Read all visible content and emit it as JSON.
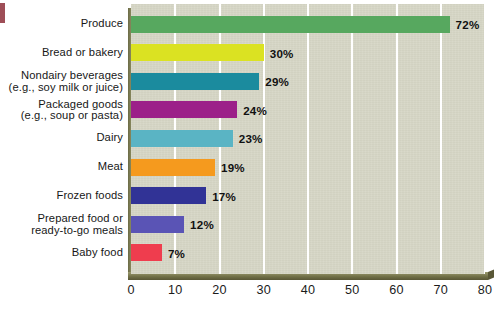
{
  "chart_data": {
    "type": "bar",
    "orientation": "horizontal",
    "title": "",
    "xlabel": "",
    "ylabel": "",
    "xlim": [
      0,
      80
    ],
    "xticks": [
      "0",
      "10",
      "20",
      "30",
      "40",
      "50",
      "60",
      "70",
      "80"
    ],
    "grid": "vertical-white-gridlines",
    "legend": "none",
    "value_suffix": "%",
    "categories": [
      "Produce",
      "Bread or bakery",
      "Nondairy beverages\n(e.g., soy milk or juice)",
      "Packaged goods\n(e.g., soup or pasta)",
      "Dairy",
      "Meat",
      "Frozen foods",
      "Prepared food or\nready-to-go meals",
      "Baby food"
    ],
    "values": [
      72,
      30,
      29,
      24,
      23,
      19,
      17,
      12,
      7
    ],
    "value_labels": [
      "72%",
      "30%",
      "29%",
      "24%",
      "23%",
      "19%",
      "17%",
      "12%",
      "7%"
    ],
    "colors": [
      "#57a85f",
      "#dbe222",
      "#1b8b9e",
      "#9c2089",
      "#5ab4c4",
      "#f59a1e",
      "#313396",
      "#5a54b5",
      "#ef3d4e"
    ],
    "plot_background": "#d7d7c6",
    "gridline_color": "#ffffff",
    "page_background": "#ffffff"
  }
}
